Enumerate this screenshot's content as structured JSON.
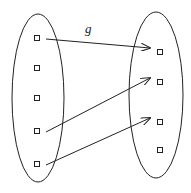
{
  "diagram": {
    "type": "function-mapping",
    "function_label": "g",
    "domain": {
      "elements": [
        "a1",
        "a2",
        "a3",
        "a4",
        "a5"
      ]
    },
    "codomain": {
      "elements": [
        "b1",
        "b2",
        "b3",
        "b4"
      ]
    },
    "mappings": [
      {
        "from": 0,
        "to": 0
      },
      {
        "from": 3,
        "to": 1
      },
      {
        "from": 4,
        "to": 2
      }
    ],
    "colors": {
      "stroke": "#222222",
      "background": "#ffffff"
    }
  }
}
